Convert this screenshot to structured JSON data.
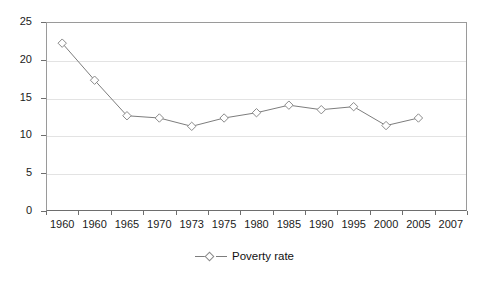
{
  "chart_data": {
    "type": "line",
    "title": "",
    "subtitle": "",
    "xlabel": "",
    "ylabel": "",
    "ylim": [
      0,
      25
    ],
    "ytick_step": 5,
    "yticks": [
      "0",
      "5",
      "10",
      "15",
      "20",
      "25"
    ],
    "grid": true,
    "grid_orientation": "horizontal",
    "legend_position": "bottom-center",
    "categories": [
      "1960",
      "1960",
      "1965",
      "1970",
      "1973",
      "1975",
      "1980",
      "1985",
      "1990",
      "1995",
      "2000",
      "2005",
      "2007"
    ],
    "series": [
      {
        "name": "Poverty rate",
        "marker": "diamond-open",
        "line_color": "#7d7d7d",
        "marker_edge_color": "#8a8a8a",
        "marker_face_color": "#ffffff",
        "values": [
          22.2,
          17.3,
          12.6,
          12.3,
          11.2,
          12.3,
          13.0,
          14.0,
          13.4,
          13.8,
          11.3,
          12.3,
          null
        ]
      }
    ]
  },
  "legend": {
    "entries": [
      {
        "label": "Poverty rate"
      }
    ]
  },
  "colors": {
    "frame": "#9a9a9a",
    "axis": "#6e6e6e",
    "gridline": "#e3e3e3",
    "series_line": "#7d7d7d",
    "text": "#1b1b1b",
    "background": "#ffffff"
  }
}
